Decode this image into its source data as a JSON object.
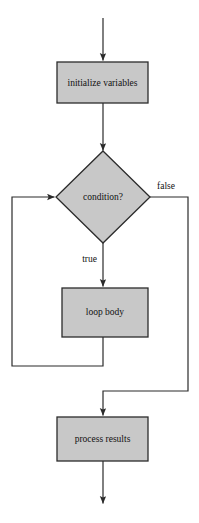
{
  "diagram": {
    "type": "flowchart",
    "style": {
      "node_fill": "#c8c8c8",
      "node_stroke": "#2b2b2b",
      "edge_stroke": "#2b2b2b",
      "background": "#ffffff",
      "text_color": "#111111"
    },
    "nodes": [
      {
        "id": "initialize",
        "shape": "rectangle",
        "label": "initialize variables",
        "x": 57,
        "y": 62,
        "width": 91,
        "height": 41
      },
      {
        "id": "condition",
        "shape": "diamond",
        "label": "condition?",
        "cx": 103,
        "cy": 197,
        "rx": 47,
        "ry": 46
      },
      {
        "id": "loop_body",
        "shape": "rectangle",
        "label": "loop body",
        "x": 62,
        "y": 288,
        "width": 86,
        "height": 49
      },
      {
        "id": "process",
        "shape": "rectangle",
        "label": "process results",
        "x": 57,
        "y": 417,
        "width": 91,
        "height": 44
      }
    ],
    "edges": [
      {
        "id": "entry",
        "from": "start",
        "to": "initialize",
        "label": ""
      },
      {
        "id": "init-to-condition",
        "from": "initialize",
        "to": "condition",
        "label": ""
      },
      {
        "id": "condition-true",
        "from": "condition",
        "to": "loop_body",
        "label": "true"
      },
      {
        "id": "condition-false",
        "from": "condition",
        "to": "process",
        "label": "false"
      },
      {
        "id": "loop-back",
        "from": "loop_body",
        "to": "condition",
        "label": ""
      },
      {
        "id": "exit",
        "from": "process",
        "to": "end",
        "label": ""
      }
    ]
  }
}
